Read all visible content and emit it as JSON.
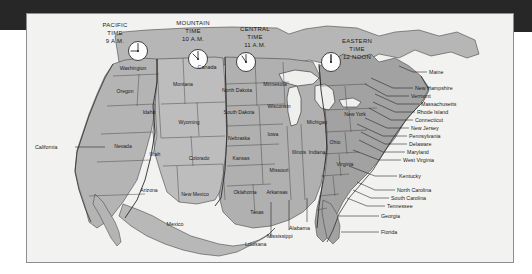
{
  "figure": {
    "kind": "us-time-zone-map",
    "background_color": "#f2f2f0",
    "band_color": "#272727",
    "land_color": "#b9b9b9",
    "water_color": "#efefed"
  },
  "time_zones": [
    {
      "id": "pacific",
      "name": "PACIFIC",
      "time_label": "TIME",
      "time": "9 A.M.",
      "clock_hour": 9,
      "clock_minute": 0,
      "fill": "#b4b4b4"
    },
    {
      "id": "mountain",
      "name": "MOUNTAIN",
      "time_label": "TIME",
      "time": "10 A.M.",
      "clock_hour": 10,
      "clock_minute": 0,
      "fill": "#bdbdbd"
    },
    {
      "id": "central",
      "name": "CENTRAL",
      "time_label": "TIME",
      "time": "11 A.M.",
      "clock_hour": 11,
      "clock_minute": 0,
      "fill": "#b0b0b0"
    },
    {
      "id": "eastern",
      "name": "EASTERN",
      "time_label": "TIME",
      "time": "12 NOON",
      "clock_hour": 12,
      "clock_minute": 0,
      "fill": "#a2a2a2"
    }
  ],
  "countries": [
    {
      "name": "Canada"
    },
    {
      "name": "Mexico"
    }
  ],
  "states_on_map": [
    {
      "name": "Washington"
    },
    {
      "name": "Oregon"
    },
    {
      "name": "Idaho"
    },
    {
      "name": "Montana"
    },
    {
      "name": "Nevada"
    },
    {
      "name": "Wyoming"
    },
    {
      "name": "Utah"
    },
    {
      "name": "Colorado"
    },
    {
      "name": "Arizona"
    },
    {
      "name": "New Mexico"
    },
    {
      "name": "North Dakota"
    },
    {
      "name": "South Dakota"
    },
    {
      "name": "Nebraska"
    },
    {
      "name": "Kansas"
    },
    {
      "name": "Oklahoma"
    },
    {
      "name": "Texas"
    },
    {
      "name": "Minnesota"
    },
    {
      "name": "Iowa"
    },
    {
      "name": "Missouri"
    },
    {
      "name": "Arkansas"
    },
    {
      "name": "Wisconsin"
    },
    {
      "name": "Illinois"
    },
    {
      "name": "Indiana"
    },
    {
      "name": "Michigan"
    },
    {
      "name": "Ohio"
    },
    {
      "name": "New York"
    },
    {
      "name": "Virginia"
    }
  ],
  "leader_labels_left": [
    {
      "name": "California"
    }
  ],
  "leader_labels_bottom": [
    {
      "name": "Louisana"
    },
    {
      "name": "Mississippi"
    },
    {
      "name": "Alabama"
    }
  ],
  "leader_labels_right": [
    {
      "name": "Maine"
    },
    {
      "name": "New Hampshire"
    },
    {
      "name": "Vermont"
    },
    {
      "name": "Massachusetts"
    },
    {
      "name": "Rhode Island"
    },
    {
      "name": "Connecticut"
    },
    {
      "name": "New Jersey"
    },
    {
      "name": "Pennsylvania"
    },
    {
      "name": "Delaware"
    },
    {
      "name": "Maryland"
    },
    {
      "name": "West Virginia"
    },
    {
      "name": "Kentucky"
    },
    {
      "name": "North Carolina"
    },
    {
      "name": "South Carolina"
    },
    {
      "name": "Tennessee"
    },
    {
      "name": "Georgia"
    },
    {
      "name": "Florida"
    }
  ]
}
